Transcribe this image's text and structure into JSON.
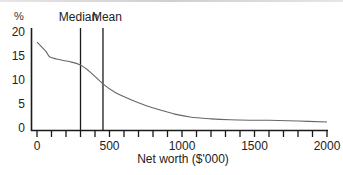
{
  "chart_data": {
    "type": "line",
    "title": "",
    "xlabel": "Net worth ($'000)",
    "ylabel": "%",
    "xlim": [
      0,
      2000
    ],
    "ylim": [
      0,
      20
    ],
    "x_ticks": [
      0,
      500,
      1000,
      1500,
      2000
    ],
    "x_minor_tick_step": 100,
    "y_ticks": [
      0,
      5,
      10,
      15,
      20
    ],
    "grid": false,
    "legend": null,
    "series": [
      {
        "name": "Distribution of net worth",
        "x": [
          0,
          60,
          90,
          160,
          230,
          300,
          365,
          455,
          540,
          640,
          750,
          850,
          950,
          1055,
          1200,
          1330,
          1500,
          1600,
          1800,
          2000
        ],
        "values": [
          17.9,
          16.0,
          14.8,
          14.2,
          13.8,
          13.1,
          11.7,
          9.2,
          7.4,
          6.0,
          4.7,
          3.75,
          2.9,
          2.3,
          1.9,
          1.7,
          1.6,
          1.6,
          1.45,
          1.25
        ]
      }
    ],
    "annotations": [
      {
        "label": "Median",
        "x": 300,
        "type": "vertical-line"
      },
      {
        "label": "Mean",
        "x": 455,
        "type": "vertical-line"
      }
    ]
  },
  "labels": {
    "y_unit": "%",
    "xlabel": "Net worth ($'000)",
    "median": "Median",
    "mean": "Mean",
    "y_tick_labels": [
      "20",
      "15",
      "10",
      "5",
      "0"
    ],
    "x_tick_labels": [
      "0",
      "500",
      "1000",
      "1500",
      "2000"
    ]
  },
  "colors": {
    "axis": "#1a1a1a",
    "curve": "#666666",
    "marker_lines": "#1a1a1a",
    "text": "#222222"
  }
}
